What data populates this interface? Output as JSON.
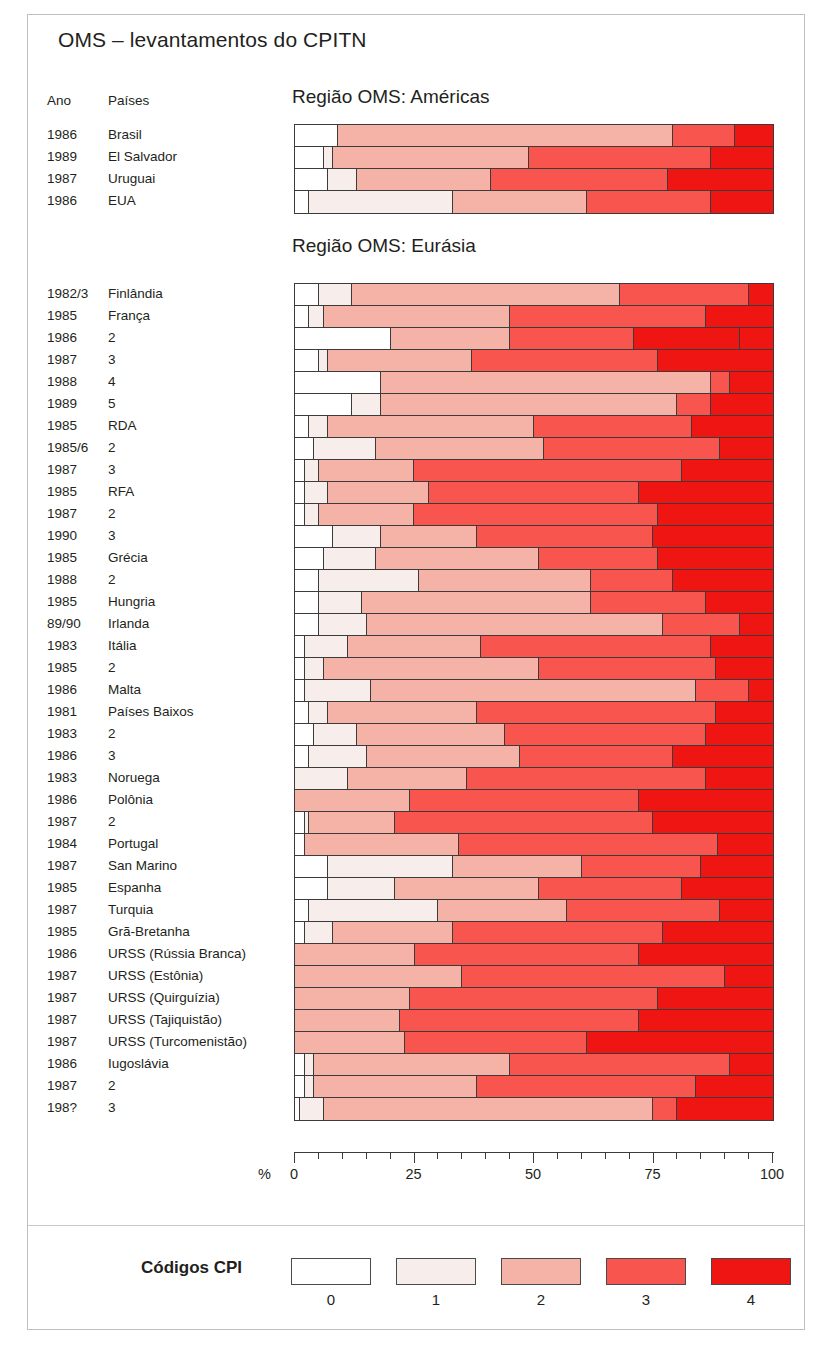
{
  "title": "OMS – levantamentos do CPITN",
  "columns": {
    "year": "Ano",
    "country": "Países"
  },
  "regions": {
    "americas": "Região OMS: Américas",
    "eurasia": "Região OMS: Eurásia"
  },
  "axis": {
    "unit": "%",
    "ticks": [
      "0",
      "25",
      "50",
      "75",
      "100"
    ],
    "tick_values": [
      0,
      25,
      50,
      75,
      100
    ],
    "minor_step": 5,
    "range": [
      0,
      100
    ]
  },
  "legend": {
    "title": "Códigos CPI",
    "items": [
      {
        "label": "0",
        "color": "#ffffff"
      },
      {
        "label": "1",
        "color": "#f7eeec"
      },
      {
        "label": "2",
        "color": "#f4b3a6"
      },
      {
        "label": "3",
        "color": "#f8554f"
      },
      {
        "label": "4",
        "color": "#ee1512"
      }
    ]
  },
  "chart_data": {
    "type": "bar",
    "orientation": "horizontal",
    "stacked": true,
    "normalized_percent": true,
    "title": "OMS – levantamentos do CPITN",
    "xlabel": "%",
    "ylabel": "",
    "xlim": [
      0,
      100
    ],
    "grid": false,
    "legend_position": "bottom",
    "legend_title": "Códigos CPI",
    "series": [
      {
        "name": "0",
        "color": "#ffffff"
      },
      {
        "name": "1",
        "color": "#f7eeec"
      },
      {
        "name": "2",
        "color": "#f4b3a6"
      },
      {
        "name": "3",
        "color": "#f8554f"
      },
      {
        "name": "4",
        "color": "#ee1512"
      }
    ],
    "groups": [
      {
        "name": "Região OMS: Américas",
        "rows": [
          {
            "year": "1986",
            "country": "Brasil",
            "values": [
              9,
              0,
              70,
              13,
              8
            ]
          },
          {
            "year": "1989",
            "country": "El Salvador",
            "values": [
              6,
              2,
              41,
              38,
              13
            ]
          },
          {
            "year": "1987",
            "country": "Uruguai",
            "values": [
              7,
              6,
              28,
              37,
              22
            ]
          },
          {
            "year": "1986",
            "country": "EUA",
            "values": [
              3,
              30,
              28,
              26,
              13
            ]
          }
        ]
      },
      {
        "name": "Região OMS: Eurásia",
        "rows": [
          {
            "year": "1982/3",
            "country": "Finlândia",
            "values": [
              5,
              7,
              56,
              27,
              5
            ]
          },
          {
            "year": "1985",
            "country": "França",
            "values": [
              3,
              3,
              39,
              41,
              14
            ]
          },
          {
            "year": "1986",
            "country": "2",
            "values": [
              20,
              0,
              25,
              26,
              22,
              7
            ]
          },
          {
            "year": "1987",
            "country": "3",
            "values": [
              5,
              2,
              30,
              39,
              24
            ]
          },
          {
            "year": "1988",
            "country": "4",
            "values": [
              18,
              0,
              69,
              4,
              9
            ]
          },
          {
            "year": "1989",
            "country": "5",
            "values": [
              12,
              6,
              62,
              7,
              13
            ]
          },
          {
            "year": "1985",
            "country": "RDA",
            "values": [
              3,
              4,
              43,
              33,
              17
            ]
          },
          {
            "year": "1985/6",
            "country": "2",
            "values": [
              4,
              13,
              35,
              37,
              11
            ]
          },
          {
            "year": "1987",
            "country": "3",
            "values": [
              2,
              3,
              20,
              56,
              19
            ]
          },
          {
            "year": "1985",
            "country": "RFA",
            "values": [
              2,
              5,
              21,
              44,
              28
            ]
          },
          {
            "year": "1987",
            "country": "2",
            "values": [
              2,
              3,
              20,
              51,
              24
            ]
          },
          {
            "year": "1990",
            "country": "3",
            "values": [
              8,
              10,
              20,
              37,
              25
            ]
          },
          {
            "year": "1985",
            "country": "Grécia",
            "values": [
              6,
              11,
              34,
              25,
              24
            ]
          },
          {
            "year": "1988",
            "country": "2",
            "values": [
              5,
              21,
              36,
              17,
              21
            ]
          },
          {
            "year": "1985",
            "country": "Hungria",
            "values": [
              5,
              9,
              48,
              24,
              14
            ]
          },
          {
            "year": "89/90",
            "country": "Irlanda",
            "values": [
              5,
              10,
              62,
              16,
              7
            ]
          },
          {
            "year": "1983",
            "country": "Itália",
            "values": [
              2,
              9,
              28,
              48,
              13
            ]
          },
          {
            "year": "1985",
            "country": "2",
            "values": [
              2,
              4,
              45,
              37,
              12
            ]
          },
          {
            "year": "1986",
            "country": "Malta",
            "values": [
              2,
              14,
              68,
              11,
              5
            ]
          },
          {
            "year": "1981",
            "country": "Países Baixos",
            "values": [
              3,
              4,
              31,
              50,
              12
            ]
          },
          {
            "year": "1983",
            "country": "2",
            "values": [
              4,
              9,
              31,
              42,
              14
            ]
          },
          {
            "year": "1986",
            "country": "3",
            "values": [
              3,
              12,
              32,
              32,
              21
            ]
          },
          {
            "year": "1983",
            "country": "Noruega",
            "values": [
              0,
              11,
              25,
              50,
              14
            ]
          },
          {
            "year": "1986",
            "country": "Polônia",
            "values": [
              0,
              0,
              24,
              48,
              28
            ]
          },
          {
            "year": "1987",
            "country": "2",
            "values": [
              2,
              1,
              18,
              54,
              25
            ]
          },
          {
            "year": "1984",
            "country": "Portugal",
            "values": [
              2,
              0,
              31,
              52,
              11
            ]
          },
          {
            "year": "1987",
            "country": "San Marino",
            "values": [
              7,
              26,
              27,
              25,
              15
            ]
          },
          {
            "year": "1985",
            "country": "Espanha",
            "values": [
              7,
              14,
              30,
              30,
              19
            ]
          },
          {
            "year": "1987",
            "country": "Turquia",
            "values": [
              3,
              27,
              27,
              32,
              11
            ]
          },
          {
            "year": "1985",
            "country": "Grã-Bretanha",
            "values": [
              2,
              6,
              25,
              44,
              23
            ]
          },
          {
            "year": "1986",
            "country": "URSS (Rússia Branca)",
            "values": [
              0,
              0,
              25,
              47,
              28
            ]
          },
          {
            "year": "1987",
            "country": "URSS (Estônia)",
            "values": [
              0,
              0,
              35,
              55,
              10
            ]
          },
          {
            "year": "1987",
            "country": "URSS (Quirguízia)",
            "values": [
              0,
              0,
              24,
              52,
              24
            ]
          },
          {
            "year": "1987",
            "country": "URSS (Tajiquistão)",
            "values": [
              0,
              0,
              22,
              50,
              28
            ]
          },
          {
            "year": "1987",
            "country": "URSS (Turcomenistão)",
            "values": [
              0,
              0,
              23,
              38,
              39
            ]
          },
          {
            "year": "1986",
            "country": "Iugoslávia",
            "values": [
              2,
              2,
              41,
              46,
              9
            ]
          },
          {
            "year": "1987",
            "country": "2",
            "values": [
              2,
              2,
              34,
              46,
              16
            ]
          },
          {
            "year": "198?",
            "country": "3",
            "values": [
              1,
              5,
              69,
              5,
              20
            ]
          }
        ]
      }
    ]
  }
}
